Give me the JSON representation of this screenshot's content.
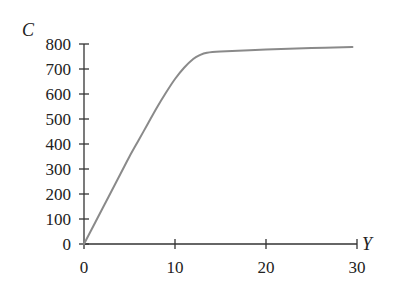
{
  "chart_data": {
    "type": "line",
    "title": "",
    "xlabel": "Y",
    "ylabel": "C",
    "xlim": [
      0,
      30
    ],
    "ylim": [
      0,
      800
    ],
    "x_ticks": [
      0,
      10,
      20,
      30
    ],
    "y_ticks": [
      0,
      100,
      200,
      300,
      400,
      500,
      600,
      700,
      800
    ],
    "x_tick_labels": [
      "0",
      "10",
      "20",
      "30"
    ],
    "y_tick_labels": [
      "0",
      "100",
      "200",
      "300",
      "400",
      "500",
      "600",
      "700",
      "800"
    ],
    "grid": false,
    "legend": null,
    "series": [
      {
        "name": "C(Y)",
        "color": "#8a8a8a",
        "x": [
          0,
          2,
          4,
          5,
          6,
          7,
          8,
          9,
          10,
          11,
          12,
          12.7,
          13.5,
          15,
          20,
          25,
          29.5
        ],
        "y": [
          0,
          140,
          280,
          350,
          415,
          480,
          545,
          605,
          660,
          705,
          740,
          755,
          765,
          770,
          778,
          784,
          788
        ]
      }
    ]
  }
}
